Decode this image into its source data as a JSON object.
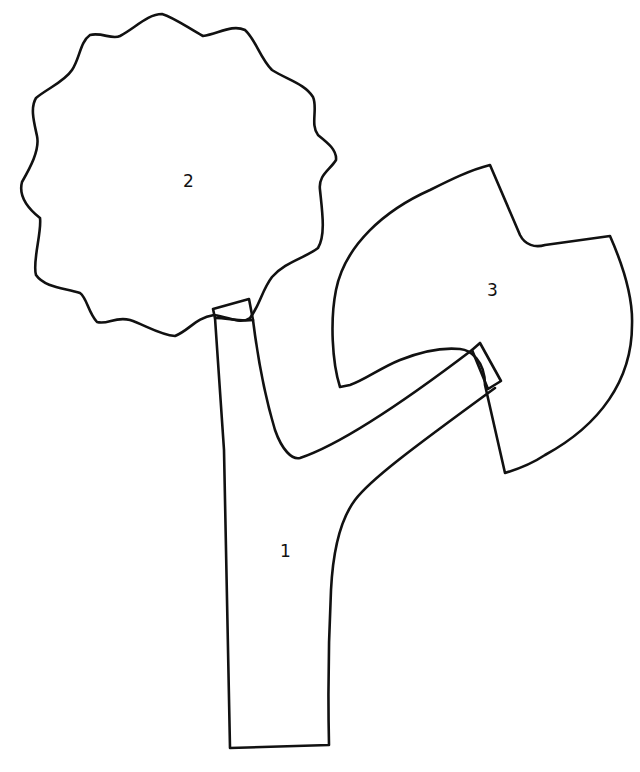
{
  "diagram": {
    "title": "",
    "background": "#ffffff",
    "stroke_color": "#111111",
    "pieces": [
      {
        "id": "1",
        "label": "1",
        "shape": "tree-trunk-with-branch"
      },
      {
        "id": "2",
        "label": "2",
        "shape": "scalloped-cloud-crown"
      },
      {
        "id": "3",
        "label": "3",
        "shape": "notched-leaf-crown"
      }
    ]
  }
}
